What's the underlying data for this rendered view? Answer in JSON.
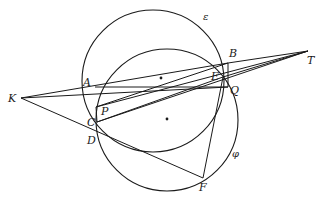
{
  "figure": {
    "stroke_color": "#1a1a1a",
    "background": "#ffffff",
    "circles": [
      {
        "name": "epsilon",
        "label": "ε",
        "cx": 153,
        "cy": 81,
        "r": 71,
        "label_x": 203,
        "label_y": 20
      },
      {
        "name": "phi",
        "label": "φ",
        "cx": 167,
        "cy": 120,
        "r": 71,
        "label_x": 232,
        "label_y": 157
      }
    ],
    "centers": [
      {
        "name": "center-epsilon",
        "x": 161,
        "y": 78
      },
      {
        "name": "center-phi",
        "x": 167,
        "y": 119
      }
    ],
    "points": [
      {
        "name": "A",
        "x": 95,
        "y": 87,
        "label": "A",
        "lx": 83,
        "ly": 86
      },
      {
        "name": "B",
        "x": 228,
        "y": 63,
        "label": "B",
        "lx": 229,
        "ly": 57
      },
      {
        "name": "T",
        "x": 308,
        "y": 51,
        "label": "T",
        "lx": 307,
        "ly": 64
      },
      {
        "name": "K",
        "x": 21,
        "y": 98,
        "label": "K",
        "lx": 8,
        "ly": 102
      },
      {
        "name": "E",
        "x": 223,
        "y": 77,
        "label": "E",
        "lx": 211,
        "ly": 80
      },
      {
        "name": "Q",
        "x": 228,
        "y": 87,
        "label": "Q",
        "lx": 230,
        "ly": 94
      },
      {
        "name": "P",
        "x": 96,
        "y": 107,
        "label": "P",
        "lx": 101,
        "ly": 115
      },
      {
        "name": "C",
        "x": 97,
        "y": 122,
        "label": "C",
        "lx": 87,
        "ly": 126
      },
      {
        "name": "D",
        "x": 96,
        "y": 138,
        "label": "D",
        "lx": 87,
        "ly": 144
      },
      {
        "name": "F",
        "x": 203,
        "y": 178,
        "label": "F",
        "lx": 199,
        "ly": 191
      }
    ],
    "segments": [
      {
        "from": "K",
        "to": "B"
      },
      {
        "from": "K",
        "to": "Q"
      },
      {
        "from": "K",
        "to": "F"
      },
      {
        "from": "A",
        "to": "Q"
      },
      {
        "from": "B",
        "to": "T"
      },
      {
        "from": "P",
        "to": "T"
      },
      {
        "from": "C",
        "to": "T"
      },
      {
        "from": "E",
        "to": "T"
      },
      {
        "from": "P",
        "to": "B"
      },
      {
        "from": "C",
        "to": "E"
      },
      {
        "from": "B",
        "to": "Q"
      },
      {
        "from": "E",
        "to": "F"
      },
      {
        "from": "P",
        "to": "C"
      }
    ],
    "caption": ""
  }
}
